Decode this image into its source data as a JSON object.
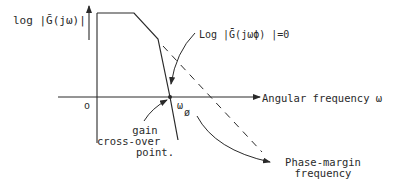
{
  "diagram": {
    "y_axis_label": "log |Ḡ(jω)|",
    "x_axis_label": "Angular frequency ω",
    "origin_label": "o",
    "crossover_freq_label": "ω",
    "crossover_freq_subscript": "ø",
    "condition_label": "Log |Ḡ(jωϕ) |=0",
    "gain_crossover_label_lines": [
      "gain",
      "cross-over",
      "point."
    ],
    "phase_margin_label_lines": [
      "Phase-margin",
      "frequency"
    ],
    "line_color": "#2a2a2a",
    "background": "#ffffff"
  }
}
